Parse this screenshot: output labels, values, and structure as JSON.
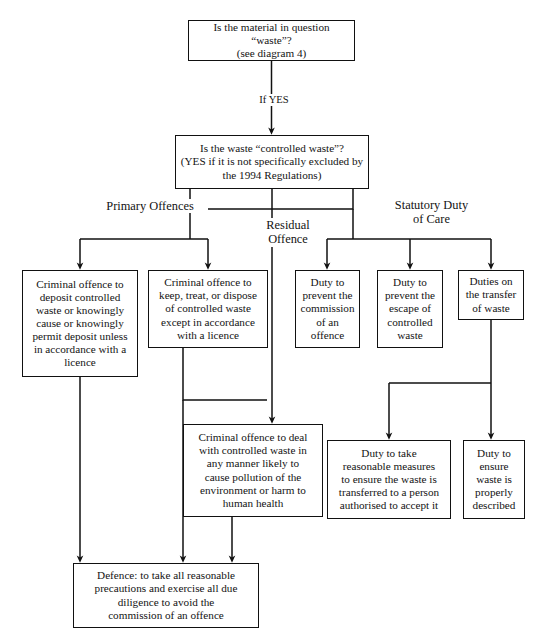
{
  "diagram": {
    "background": "#ffffff",
    "line_color": "#111111",
    "text_color": "#131313"
  },
  "nodes": {
    "q_waste": {
      "text": "Is the material in question “waste”?\n(see diagram 4)",
      "x": 188,
      "y": 20,
      "w": 167,
      "h": 41,
      "font": 11.2
    },
    "q_controlled": {
      "text": "Is the waste “controlled waste”?\n(YES if it is not specifically excluded by\nthe 1994 Regulations)",
      "x": 175,
      "y": 135,
      "w": 194,
      "h": 54,
      "font": 11.2
    },
    "deposit_offence": {
      "text": "Criminal offence to\ndeposit controlled\nwaste or knowingly\ncause or knowingly\npermit deposit unless\nin accordance with a\nlicence",
      "x": 22,
      "y": 270,
      "w": 116,
      "h": 107,
      "font": 11.2
    },
    "keep_treat_offence": {
      "text": "Criminal offence to\nkeep, treat, or dispose\nof controlled waste\nexcept in accordance\nwith a licence",
      "x": 148,
      "y": 270,
      "w": 120,
      "h": 78,
      "font": 11.2
    },
    "prevent_commission": {
      "text": "Duty to\nprevent the\ncommission\nof an\noffence",
      "x": 295,
      "y": 270,
      "w": 65,
      "h": 78,
      "font": 11.2
    },
    "prevent_escape": {
      "text": "Duty to\nprevent the\nescape of\ncontrolled\nwaste",
      "x": 377,
      "y": 270,
      "w": 66,
      "h": 78,
      "font": 11.2
    },
    "duties_transfer": {
      "text": "Duties on\nthe transfer\nof waste",
      "x": 458,
      "y": 270,
      "w": 66,
      "h": 50,
      "font": 11.2
    },
    "residual_offence": {
      "text": "Criminal offence to deal\nwith controlled waste in\nany manner likely to\ncause pollution of the\nenvironment or harm to\nhuman health",
      "x": 183,
      "y": 424,
      "w": 140,
      "h": 93,
      "font": 11.2
    },
    "reasonable_measures": {
      "text": "Duty to take\nreasonable measures\nto ensure the waste is\ntransferred to a person\nauthorised to accept it",
      "x": 327,
      "y": 440,
      "w": 124,
      "h": 79,
      "font": 11.2
    },
    "properly_described": {
      "text": "Duty to\nensure\nwaste is\nproperly\ndescribed",
      "x": 463,
      "y": 440,
      "w": 62,
      "h": 79,
      "font": 11.2
    },
    "defence": {
      "text": "Defence: to take all reasonable\nprecautions and exercise all due\ndiligence to avoid the\ncommission of an offence",
      "x": 73,
      "y": 563,
      "w": 186,
      "h": 65,
      "font": 11.2
    }
  },
  "edge_labels": {
    "if_yes": {
      "text": "If YES",
      "x": 246,
      "y": 94,
      "w": 52,
      "font": 10.6
    },
    "primary_offences": {
      "text": "Primary Offences",
      "x": 92,
      "y": 199,
      "w": 112,
      "font": 12.4
    },
    "residual_offence_label": {
      "text": "Residual\nOffence",
      "x": 257,
      "y": 218,
      "w": 58,
      "font": 12.4
    },
    "statutory_duty": {
      "text": "Statutory Duty\nof Care",
      "x": 382,
      "y": 198,
      "w": 95,
      "font": 12.4
    }
  },
  "edges": [
    {
      "name": "waste-to-controlled",
      "kind": "arrow"
    },
    {
      "name": "controlled-to-primary-branch",
      "kind": "tree"
    },
    {
      "name": "controlled-to-residual",
      "kind": "arrow"
    },
    {
      "name": "controlled-to-statutory-branch",
      "kind": "tree"
    },
    {
      "name": "keep-treat-to-residual",
      "kind": "arrow"
    },
    {
      "name": "duties-transfer-to-lower-duties",
      "kind": "tree"
    },
    {
      "name": "deposit-to-defence",
      "kind": "arrow"
    },
    {
      "name": "keep-treat-to-defence",
      "kind": "arrow"
    },
    {
      "name": "residual-to-defence",
      "kind": "arrow"
    }
  ]
}
